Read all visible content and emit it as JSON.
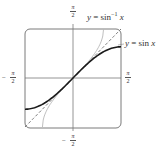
{
  "chart_data": {
    "type": "line",
    "title": "",
    "xlabel": "",
    "ylabel": "",
    "xlim": [
      "-π/2",
      "π/2"
    ],
    "ylim": [
      "-π/2",
      "π/2"
    ],
    "grid": false,
    "frame": "rounded-square",
    "tick_labels": {
      "x_left": "-π/2",
      "x_right": "π/2",
      "y_top": "π/2",
      "y_bottom": "-π/2"
    },
    "series": [
      {
        "name": "y = sin x",
        "style": "solid-thick-dark",
        "function": "sin(x)",
        "domain": [
          -1.5708,
          1.5708
        ],
        "color": "#1a1a1a"
      },
      {
        "name": "y = sin⁻¹ x",
        "style": "solid-thin-light",
        "function": "asin(x)",
        "domain": [
          -1,
          1
        ],
        "color": "#b8b8b8"
      },
      {
        "name": "y = x",
        "style": "dashed",
        "function": "x",
        "domain": [
          -1.5708,
          1.5708
        ],
        "color": "#555555"
      }
    ],
    "annotations": [
      {
        "text": "y = sin⁻¹ x",
        "points_to": "arcsin curve near top"
      },
      {
        "text": "y = sin x",
        "points_to": "sin curve near right edge"
      }
    ]
  },
  "labels": {
    "pi": "π",
    "two": "2",
    "minus": "−",
    "sin_inv_y": "y",
    "sin_inv_eq": " = sin",
    "sin_inv_sup": "−1",
    "sin_inv_x": " x",
    "sin_y": "y",
    "sin_eq": " = sin ",
    "sin_x": "x"
  },
  "colors": {
    "frame": "#7a7a7a",
    "axes": "#7a7a7a",
    "sin": "#1a1a1a",
    "arcsin": "#bdbdbd",
    "identity": "#555555"
  }
}
